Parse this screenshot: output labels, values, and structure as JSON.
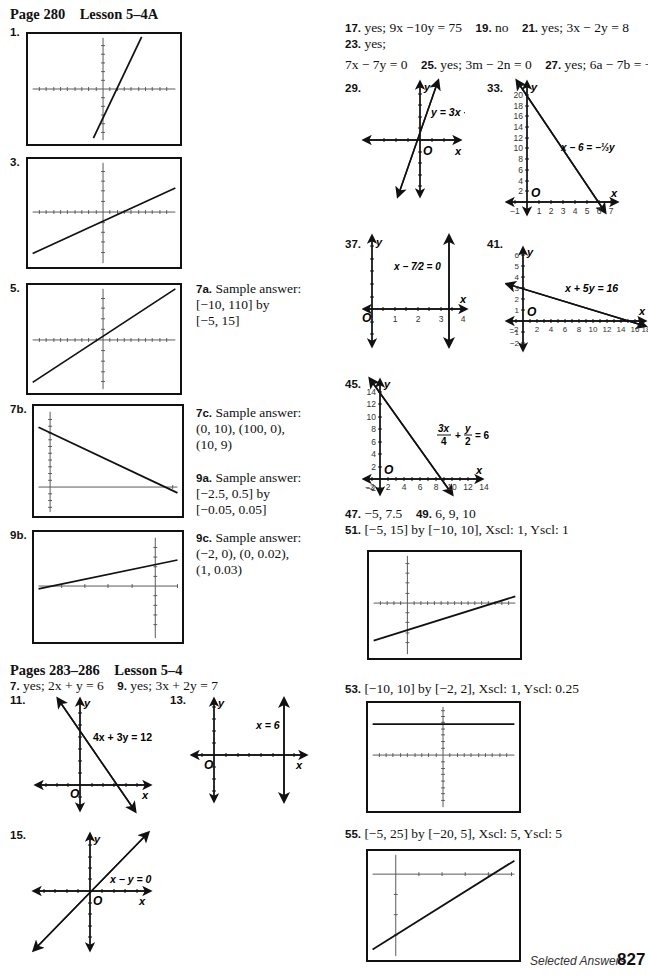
{
  "page": {
    "number": "827",
    "footer_label": "Selected Answers"
  },
  "left": {
    "section1": {
      "heading": "Page 280    Lesson 5–4A",
      "items": [
        {
          "label": "1."
        },
        {
          "label": "3."
        },
        {
          "label": "5."
        },
        {
          "label": "7b."
        },
        {
          "label": "9b."
        }
      ],
      "side_answers": [
        {
          "label": "7a.",
          "lines": [
            "Sample answer:",
            "[−10, 110] by",
            "[−5, 15]"
          ]
        },
        {
          "label": "7c.",
          "lines": [
            "Sample answer:",
            "(0, 10), (100, 0),",
            "(10, 9)"
          ]
        },
        {
          "label": "9a.",
          "lines": [
            "Sample answer:",
            "[−2.5, 0.5] by",
            "[−0.05, 0.05]"
          ]
        },
        {
          "label": "9c.",
          "lines": [
            "Sample answer:",
            "(−2, 0), (0, 0.02),",
            "(1, 0.03)"
          ]
        }
      ]
    },
    "section2": {
      "heading": "Pages 283–286    Lesson 5–4",
      "line1": [
        {
          "label": "7.",
          "text": "yes; 2x + y = 6"
        },
        {
          "label": "9.",
          "text": "yes; 3x + 2y = 7"
        }
      ],
      "graphs": [
        {
          "label": "11.",
          "equation": "4x + 3y = 12"
        },
        {
          "label": "13.",
          "equation": "x = 6"
        },
        {
          "label": "15.",
          "equation": "x − y = 0"
        }
      ]
    }
  },
  "right": {
    "line1": [
      {
        "label": "17.",
        "text": "yes; 9x −10y = 75"
      },
      {
        "label": "19.",
        "text": "no"
      },
      {
        "label": "21.",
        "text": "yes; 3x − 2y = 8"
      }
    ],
    "line2": [
      {
        "label": "23.",
        "text": "yes;"
      }
    ],
    "line3": [
      {
        "label": "",
        "text": "7x − 7y = 0"
      },
      {
        "label": "25.",
        "text": "yes; 3m − 2n = 0"
      },
      {
        "label": "27.",
        "text": "yes; 6a − 7b = −5"
      }
    ],
    "graphs": [
      {
        "label": "29.",
        "equation": "y = 3x + 1"
      },
      {
        "label": "33.",
        "equation": "x − 6 = −⅓y",
        "y_ticks": [
          "2",
          "4",
          "6",
          "8",
          "10",
          "12",
          "14",
          "16",
          "18",
          "20"
        ],
        "x_ticks": [
          "−1",
          "1",
          "2",
          "3",
          "4",
          "5",
          "6",
          "7"
        ]
      },
      {
        "label": "37.",
        "equation": "x − 7/2 = 0",
        "x_ticks": [
          "1",
          "2",
          "3",
          "4"
        ]
      },
      {
        "label": "41.",
        "equation": "x + 5y = 16",
        "y_ticks": [
          "−2",
          "−1",
          "1",
          "2",
          "3",
          "4",
          "5",
          "6"
        ],
        "x_ticks": [
          "−2",
          "2",
          "4",
          "6",
          "8",
          "10",
          "12",
          "14",
          "16",
          "18"
        ]
      },
      {
        "label": "45.",
        "equation": "3x/4 + y/2 = 6",
        "y_ticks": [
          "−2",
          "2",
          "4",
          "6",
          "8",
          "10",
          "12",
          "14"
        ],
        "x_ticks": [
          "−2",
          "2",
          "4",
          "6",
          "8",
          "10",
          "12",
          "14"
        ]
      }
    ],
    "line4": [
      {
        "label": "47.",
        "text": "−5, 7.5"
      },
      {
        "label": "49.",
        "text": "6, 9, 10"
      }
    ],
    "windows": [
      {
        "label": "51.",
        "text": "[−5, 15] by [−10, 10], Xscl: 1, Yscl: 1"
      },
      {
        "label": "53.",
        "text": "[−10, 10] by [−2, 2], Xscl: 1, Yscl: 0.25"
      },
      {
        "label": "55.",
        "text": "[−5, 25] by [−20, 5], Xscl: 5, Yscl: 5"
      }
    ]
  },
  "axis_labels": {
    "x": "x",
    "y": "y",
    "origin": "O"
  }
}
